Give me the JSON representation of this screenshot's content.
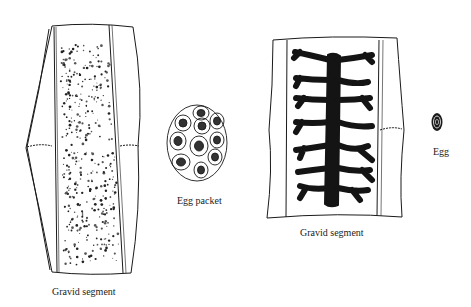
{
  "figure": {
    "panels": [
      {
        "id": "left-gravid-segment",
        "label": "Gravid segment"
      },
      {
        "id": "egg-packet",
        "label": "Egg packet"
      },
      {
        "id": "right-gravid-segment",
        "label": "Gravid segment"
      },
      {
        "id": "egg",
        "label": "Egg"
      }
    ]
  },
  "colors": {
    "ink": "#1a1a1a",
    "background": "#ffffff"
  }
}
